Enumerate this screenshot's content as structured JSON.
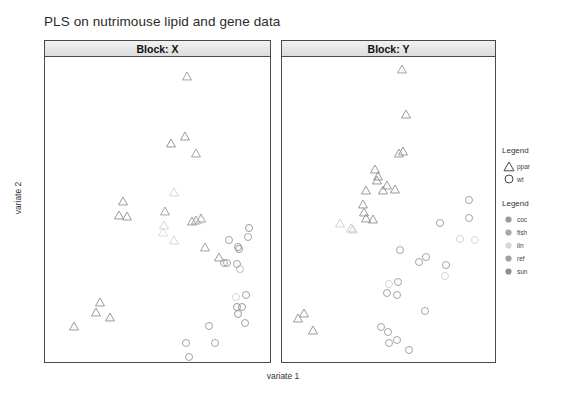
{
  "title": "PLS on nutrimouse lipid and gene data",
  "axis": {
    "xlabel": "variate 1",
    "ylabel": "variate 2"
  },
  "legend_shape": {
    "title": "Legend",
    "items": [
      {
        "label": "ppar",
        "shape": "triangle-marker"
      },
      {
        "label": "wt",
        "shape": "circle-marker"
      }
    ]
  },
  "legend_color": {
    "title": "Legend",
    "items": [
      {
        "label": "coc",
        "color": "#9b9b9b"
      },
      {
        "label": "fish",
        "color": "#a8a8a8"
      },
      {
        "label": "lin",
        "color": "#d6d6d6"
      },
      {
        "label": "ref",
        "color": "#a0a0a0"
      },
      {
        "label": "sun",
        "color": "#8f8f8f"
      }
    ]
  },
  "chart_data": {
    "type": "scatter",
    "title": "PLS on nutrimouse lipid and gene data",
    "xlabel": "variate 1",
    "ylabel": "variate 2",
    "grid": false,
    "legend_position": "right",
    "panels": [
      {
        "name": "Block: X",
        "xlim": [
          -6.9,
          3.3
        ],
        "ylim": [
          -3.0,
          5.9
        ],
        "xticks": [
          -6,
          -4,
          -2,
          0,
          2
        ],
        "yticks": [
          -2,
          0,
          2,
          4
        ],
        "points": [
          {
            "x": -0.45,
            "y": 5.35,
            "group": "ppar",
            "diet": "lin",
            "color": "#9a9a9a"
          },
          {
            "x": -1.2,
            "y": 3.4,
            "group": "ppar",
            "diet": "coc",
            "color": "#8e8e8e"
          },
          {
            "x": -0.55,
            "y": 3.6,
            "group": "ppar",
            "diet": "fish",
            "color": "#8e8e8e"
          },
          {
            "x": -0.05,
            "y": 3.1,
            "group": "ppar",
            "diet": "ref",
            "color": "#9a9a9a"
          },
          {
            "x": -1.05,
            "y": 1.95,
            "group": "ppar",
            "diet": "lin",
            "color": "#cfcfcf"
          },
          {
            "x": -3.35,
            "y": 1.7,
            "group": "ppar",
            "diet": "coc",
            "color": "#8e8e8e"
          },
          {
            "x": -3.55,
            "y": 1.3,
            "group": "ppar",
            "diet": "sun",
            "color": "#8e8e8e"
          },
          {
            "x": -3.2,
            "y": 1.25,
            "group": "ppar",
            "diet": "ref",
            "color": "#8e8e8e"
          },
          {
            "x": -1.45,
            "y": 1.4,
            "group": "ppar",
            "diet": "fish",
            "color": "#9a9a9a"
          },
          {
            "x": -1.5,
            "y": 1.0,
            "group": "ppar",
            "diet": "lin",
            "color": "#cfcfcf"
          },
          {
            "x": -1.55,
            "y": 0.8,
            "group": "ppar",
            "diet": "lin",
            "color": "#d6d6d6"
          },
          {
            "x": -0.25,
            "y": 1.1,
            "group": "ppar",
            "diet": "coc",
            "color": "#8e8e8e"
          },
          {
            "x": -0.05,
            "y": 1.15,
            "group": "ppar",
            "diet": "ref",
            "color": "#9a9a9a"
          },
          {
            "x": 0.15,
            "y": 1.2,
            "group": "ppar",
            "diet": "sun",
            "color": "#8e8e8e"
          },
          {
            "x": -1.05,
            "y": 0.55,
            "group": "ppar",
            "diet": "lin",
            "color": "#d0d0d0"
          },
          {
            "x": 0.35,
            "y": 0.35,
            "group": "ppar",
            "diet": "fish",
            "color": "#9a9a9a"
          },
          {
            "x": 1.0,
            "y": 0.05,
            "group": "ppar",
            "diet": "ref",
            "color": "#8e8e8e"
          },
          {
            "x": -4.4,
            "y": -1.25,
            "group": "ppar",
            "diet": "coc",
            "color": "#8e8e8e"
          },
          {
            "x": -4.6,
            "y": -1.55,
            "group": "ppar",
            "diet": "sun",
            "color": "#8e8e8e"
          },
          {
            "x": -3.95,
            "y": -1.7,
            "group": "ppar",
            "diet": "ref",
            "color": "#8e8e8e"
          },
          {
            "x": -5.6,
            "y": -1.95,
            "group": "ppar",
            "diet": "fish",
            "color": "#8e8e8e"
          },
          {
            "x": 0.15,
            "y": 1.15,
            "group": "wt",
            "diet": "lin",
            "color": "#cfcfcf"
          },
          {
            "x": 1.45,
            "y": 0.55,
            "group": "wt",
            "diet": "coc",
            "color": "#9a9a9a"
          },
          {
            "x": 1.85,
            "y": 0.35,
            "group": "wt",
            "diet": "ref",
            "color": "#8e8e8e"
          },
          {
            "x": 1.9,
            "y": 0.3,
            "group": "wt",
            "diet": "sun",
            "color": "#8e8e8e"
          },
          {
            "x": 2.3,
            "y": 0.65,
            "group": "wt",
            "diet": "fish",
            "color": "#9a9a9a"
          },
          {
            "x": 1.2,
            "y": -0.1,
            "group": "wt",
            "diet": "coc",
            "color": "#9a9a9a"
          },
          {
            "x": 1.35,
            "y": -0.1,
            "group": "wt",
            "diet": "ref",
            "color": "#9a9a9a"
          },
          {
            "x": 1.8,
            "y": -0.15,
            "group": "wt",
            "diet": "sun",
            "color": "#9a9a9a"
          },
          {
            "x": 1.95,
            "y": -0.3,
            "group": "wt",
            "diet": "lin",
            "color": "#b5b5b5"
          },
          {
            "x": 1.75,
            "y": -1.1,
            "group": "wt",
            "diet": "lin",
            "color": "#d0d0d0"
          },
          {
            "x": 2.2,
            "y": -1.05,
            "group": "wt",
            "diet": "fish",
            "color": "#9a9a9a"
          },
          {
            "x": 1.8,
            "y": -1.4,
            "group": "wt",
            "diet": "coc",
            "color": "#8e8e8e"
          },
          {
            "x": 1.85,
            "y": -1.6,
            "group": "wt",
            "diet": "sun",
            "color": "#8e8e8e"
          },
          {
            "x": 2.05,
            "y": -1.4,
            "group": "wt",
            "diet": "ref",
            "color": "#8e8e8e"
          },
          {
            "x": 2.15,
            "y": -1.85,
            "group": "wt",
            "diet": "fish",
            "color": "#9a9a9a"
          },
          {
            "x": 0.55,
            "y": -1.95,
            "group": "wt",
            "diet": "ref",
            "color": "#9a9a9a"
          },
          {
            "x": 0.8,
            "y": -2.45,
            "group": "wt",
            "diet": "coc",
            "color": "#9a9a9a"
          },
          {
            "x": -0.5,
            "y": -2.45,
            "group": "wt",
            "diet": "sun",
            "color": "#9a9a9a"
          },
          {
            "x": -0.35,
            "y": -2.85,
            "group": "wt",
            "diet": "lin",
            "color": "#9a9a9a"
          },
          {
            "x": 2.35,
            "y": 0.9,
            "group": "wt",
            "diet": "lin",
            "color": "#8e8e8e"
          }
        ]
      },
      {
        "name": "Block: Y",
        "xlim": [
          -13.5,
          11.5
        ],
        "ylim": [
          -8.5,
          13.5
        ],
        "xticks": [
          -10,
          -5,
          0,
          5,
          10
        ],
        "yticks": [
          -5,
          0,
          5,
          10
        ],
        "points": [
          {
            "x": 0.6,
            "y": 12.6,
            "group": "ppar",
            "diet": "lin",
            "color": "#9a9a9a"
          },
          {
            "x": 1.0,
            "y": 9.4,
            "group": "ppar",
            "diet": "coc",
            "color": "#8e8e8e"
          },
          {
            "x": 0.2,
            "y": 6.6,
            "group": "ppar",
            "diet": "fish",
            "color": "#8e8e8e"
          },
          {
            "x": 0.7,
            "y": 6.7,
            "group": "ppar",
            "diet": "ref",
            "color": "#8e8e8e"
          },
          {
            "x": -2.4,
            "y": 4.6,
            "group": "ppar",
            "diet": "coc",
            "color": "#8e8e8e"
          },
          {
            "x": -2.25,
            "y": 4.9,
            "group": "ppar",
            "diet": "sun",
            "color": "#8e8e8e"
          },
          {
            "x": -3.6,
            "y": 3.9,
            "group": "ppar",
            "diet": "lin",
            "color": "#8e8e8e"
          },
          {
            "x": -1.6,
            "y": 3.9,
            "group": "ppar",
            "diet": "ref",
            "color": "#8e8e8e"
          },
          {
            "x": -1.2,
            "y": 4.3,
            "group": "ppar",
            "diet": "fish",
            "color": "#8e8e8e"
          },
          {
            "x": -0.2,
            "y": 4.0,
            "group": "ppar",
            "diet": "coc",
            "color": "#8e8e8e"
          },
          {
            "x": -4.0,
            "y": 2.9,
            "group": "ppar",
            "diet": "sun",
            "color": "#8e8e8e"
          },
          {
            "x": -3.9,
            "y": 2.3,
            "group": "ppar",
            "diet": "ref",
            "color": "#8e8e8e"
          },
          {
            "x": -3.6,
            "y": 1.9,
            "group": "ppar",
            "diet": "lin",
            "color": "#8e8e8e"
          },
          {
            "x": -2.8,
            "y": 1.8,
            "group": "ppar",
            "diet": "fish",
            "color": "#8e8e8e"
          },
          {
            "x": -6.7,
            "y": 1.5,
            "group": "ppar",
            "diet": "lin",
            "color": "#cfcfcf"
          },
          {
            "x": -5.4,
            "y": 1.2,
            "group": "ppar",
            "diet": "lin",
            "color": "#cdcdcd"
          },
          {
            "x": -5.2,
            "y": 1.1,
            "group": "ppar",
            "diet": "sun",
            "color": "#cdcdcd"
          },
          {
            "x": -10.9,
            "y": -5.0,
            "group": "ppar",
            "diet": "coc",
            "color": "#8e8e8e"
          },
          {
            "x": -11.6,
            "y": -5.3,
            "group": "ppar",
            "diet": "fish",
            "color": "#8e8e8e"
          },
          {
            "x": -9.9,
            "y": -6.2,
            "group": "ppar",
            "diet": "ref",
            "color": "#8e8e8e"
          },
          {
            "x": -2.6,
            "y": 5.4,
            "group": "ppar",
            "diet": "ref",
            "color": "#8e8e8e"
          },
          {
            "x": 8.4,
            "y": 3.2,
            "group": "wt",
            "diet": "coc",
            "color": "#9a9a9a"
          },
          {
            "x": 8.5,
            "y": 1.9,
            "group": "wt",
            "diet": "fish",
            "color": "#9a9a9a"
          },
          {
            "x": 5.1,
            "y": 1.5,
            "group": "wt",
            "diet": "ref",
            "color": "#9a9a9a"
          },
          {
            "x": 7.4,
            "y": 0.4,
            "group": "wt",
            "diet": "lin",
            "color": "#cdcdcd"
          },
          {
            "x": 9.2,
            "y": 0.3,
            "group": "wt",
            "diet": "lin",
            "color": "#d2d2d2"
          },
          {
            "x": 0.3,
            "y": -0.4,
            "group": "wt",
            "diet": "coc",
            "color": "#9a9a9a"
          },
          {
            "x": 2.6,
            "y": -1.3,
            "group": "wt",
            "diet": "ref",
            "color": "#9a9a9a"
          },
          {
            "x": 3.4,
            "y": -0.9,
            "group": "wt",
            "diet": "sun",
            "color": "#9a9a9a"
          },
          {
            "x": 5.7,
            "y": -1.5,
            "group": "wt",
            "diet": "fish",
            "color": "#9a9a9a"
          },
          {
            "x": 5.6,
            "y": -2.3,
            "group": "wt",
            "diet": "lin",
            "color": "#cdcdcd"
          },
          {
            "x": 0.1,
            "y": -2.7,
            "group": "wt",
            "diet": "coc",
            "color": "#9a9a9a"
          },
          {
            "x": -1.0,
            "y": -2.9,
            "group": "wt",
            "diet": "lin",
            "color": "#cdcdcd"
          },
          {
            "x": -1.2,
            "y": -3.5,
            "group": "wt",
            "diet": "ref",
            "color": "#9a9a9a"
          },
          {
            "x": 0.0,
            "y": -3.7,
            "group": "wt",
            "diet": "sun",
            "color": "#9a9a9a"
          },
          {
            "x": 3.3,
            "y": -4.8,
            "group": "wt",
            "diet": "coc",
            "color": "#9a9a9a"
          },
          {
            "x": -1.9,
            "y": -6.0,
            "group": "wt",
            "diet": "fish",
            "color": "#9a9a9a"
          },
          {
            "x": -1.1,
            "y": -6.3,
            "group": "wt",
            "diet": "ref",
            "color": "#9a9a9a"
          },
          {
            "x": -0.95,
            "y": -7.1,
            "group": "wt",
            "diet": "sun",
            "color": "#9a9a9a"
          },
          {
            "x": -0.05,
            "y": -6.9,
            "group": "wt",
            "diet": "coc",
            "color": "#9a9a9a"
          },
          {
            "x": 1.4,
            "y": -7.6,
            "group": "wt",
            "diet": "lin",
            "color": "#9a9a9a"
          }
        ]
      }
    ]
  }
}
